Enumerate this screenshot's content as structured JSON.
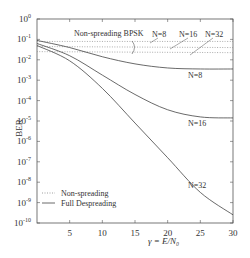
{
  "chart_data": {
    "type": "line",
    "title": "",
    "xlabel": "γ = E/N₀",
    "ylabel": "BER",
    "xlim": [
      0,
      30
    ],
    "ylim_log10": [
      -10,
      0
    ],
    "yscale": "log",
    "grid": false,
    "x_ticks": [
      5,
      10,
      15,
      20,
      25,
      30
    ],
    "y_ticks": [
      "10^0",
      "10^-1",
      "10^-2",
      "10^-3",
      "10^-4",
      "10^-5",
      "10^-6",
      "10^-7",
      "10^-8",
      "10^-9",
      "10^-10"
    ],
    "legend": {
      "position": "lower-left",
      "entries": [
        {
          "label": "Non-spreading",
          "style": "dotted"
        },
        {
          "label": "Full Despreading",
          "style": "solid"
        }
      ]
    },
    "annotations": {
      "group_label": "Non-spreading BPSK",
      "dotted_labels": [
        "N=8",
        "N=16",
        "N=32"
      ],
      "solid_labels": [
        "N=8",
        "N=16",
        "N=32"
      ]
    },
    "series": [
      {
        "name": "Non-spreading N=8",
        "style": "dotted",
        "x": [
          0,
          30
        ],
        "log10_y": [
          -1.1,
          -1.1
        ]
      },
      {
        "name": "Non-spreading N=16",
        "style": "dotted",
        "x": [
          0,
          30
        ],
        "log10_y": [
          -1.35,
          -1.4
        ]
      },
      {
        "name": "Non-spreading N=32",
        "style": "dotted",
        "x": [
          0,
          30
        ],
        "log10_y": [
          -1.6,
          -1.65
        ]
      },
      {
        "name": "Full Despreading N=8",
        "style": "solid",
        "x": [
          0,
          5,
          10,
          15,
          20,
          25,
          30
        ],
        "log10_y": [
          -1.05,
          -1.4,
          -1.85,
          -2.2,
          -2.4,
          -2.45,
          -2.45
        ]
      },
      {
        "name": "Full Despreading N=16",
        "style": "solid",
        "x": [
          0,
          5,
          10,
          15,
          20,
          25,
          30
        ],
        "log10_y": [
          -1.2,
          -1.8,
          -2.75,
          -3.7,
          -4.45,
          -4.8,
          -4.85
        ]
      },
      {
        "name": "Full Despreading N=32",
        "style": "solid",
        "x": [
          0,
          5,
          10,
          15,
          20,
          25,
          30
        ],
        "log10_y": [
          -1.3,
          -2.05,
          -3.4,
          -5.1,
          -6.8,
          -8.5,
          -9.6
        ]
      }
    ]
  }
}
